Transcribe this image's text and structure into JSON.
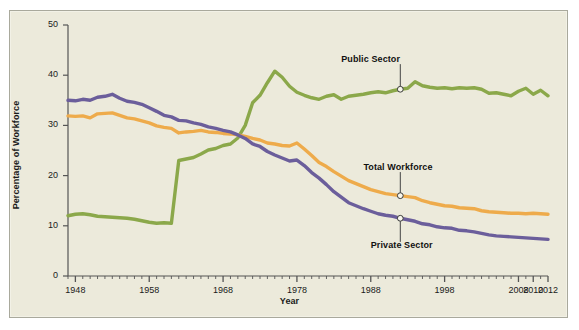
{
  "chart_data": {
    "type": "line",
    "title": "",
    "xlabel": "Year",
    "ylabel": "Percentage of Workforce",
    "xlim": [
      1947,
      2012
    ],
    "ylim": [
      0,
      50
    ],
    "y_ticks": [
      0,
      10,
      20,
      30,
      40,
      50
    ],
    "x_tick_labels": [
      "1948",
      "1958",
      "1968",
      "1978",
      "1988",
      "1998",
      "2008",
      "2010",
      "2012"
    ],
    "x_tick_values": [
      1948,
      1958,
      1968,
      1978,
      1988,
      1998,
      2008,
      2010,
      2012
    ],
    "minor_tick_interval": 1,
    "grid": false,
    "legend": "inline-annotations",
    "colors": {
      "public_sector": "#8ba84a",
      "total_workforce": "#eeab4b",
      "private_sector": "#6b5e9b",
      "background": "#eceadb",
      "frame": "#a9a99c",
      "axis": "#555555",
      "text": "#1a1a1a"
    },
    "series": [
      {
        "name": "Public Sector",
        "color": "#8ba84a",
        "x": [
          1947,
          1948,
          1949,
          1950,
          1951,
          1952,
          1953,
          1954,
          1955,
          1956,
          1957,
          1958,
          1959,
          1960,
          1961,
          1962,
          1963,
          1964,
          1965,
          1966,
          1967,
          1968,
          1969,
          1970,
          1971,
          1972,
          1973,
          1974,
          1975,
          1976,
          1977,
          1978,
          1979,
          1980,
          1981,
          1982,
          1983,
          1984,
          1985,
          1986,
          1987,
          1988,
          1989,
          1990,
          1991,
          1992,
          1993,
          1994,
          1995,
          1996,
          1997,
          1998,
          1999,
          2000,
          2001,
          2002,
          2003,
          2004,
          2005,
          2006,
          2007,
          2008,
          2009,
          2010,
          2011,
          2012
        ],
        "y": [
          12.0,
          12.3,
          12.4,
          12.2,
          11.9,
          11.8,
          11.7,
          11.6,
          11.5,
          11.3,
          11.0,
          10.7,
          10.5,
          10.6,
          10.5,
          23.0,
          23.3,
          23.6,
          24.3,
          25.1,
          25.4,
          26.0,
          26.3,
          27.5,
          30.0,
          34.5,
          36.0,
          38.5,
          40.8,
          39.6,
          37.8,
          36.6,
          36.0,
          35.5,
          35.2,
          35.8,
          36.1,
          35.2,
          35.8,
          36.0,
          36.2,
          36.5,
          36.7,
          36.5,
          36.9,
          37.2,
          37.4,
          38.7,
          37.9,
          37.6,
          37.4,
          37.5,
          37.3,
          37.5,
          37.4,
          37.5,
          37.2,
          36.4,
          36.5,
          36.2,
          35.9,
          36.8,
          37.4,
          36.2,
          37.0,
          35.9
        ]
      },
      {
        "name": "Total Workforce",
        "color": "#eeab4b",
        "x": [
          1947,
          1948,
          1949,
          1950,
          1951,
          1952,
          1953,
          1954,
          1955,
          1956,
          1957,
          1958,
          1959,
          1960,
          1961,
          1962,
          1963,
          1964,
          1965,
          1966,
          1967,
          1968,
          1969,
          1970,
          1971,
          1972,
          1973,
          1974,
          1975,
          1976,
          1977,
          1978,
          1979,
          1980,
          1981,
          1982,
          1983,
          1984,
          1985,
          1986,
          1987,
          1988,
          1989,
          1990,
          1991,
          1992,
          1993,
          1994,
          1995,
          1996,
          1997,
          1998,
          1999,
          2000,
          2001,
          2002,
          2003,
          2004,
          2005,
          2006,
          2007,
          2008,
          2009,
          2010,
          2011,
          2012
        ],
        "y": [
          31.9,
          31.8,
          31.9,
          31.5,
          32.3,
          32.4,
          32.5,
          32.0,
          31.5,
          31.3,
          30.9,
          30.5,
          29.9,
          29.6,
          29.4,
          28.5,
          28.7,
          28.8,
          29.0,
          28.7,
          28.6,
          28.4,
          28.3,
          28.1,
          27.8,
          27.4,
          27.1,
          26.5,
          26.3,
          26.0,
          25.9,
          26.5,
          25.3,
          24.0,
          22.6,
          21.8,
          20.8,
          19.9,
          19.0,
          18.4,
          17.8,
          17.2,
          16.8,
          16.4,
          16.2,
          16.0,
          15.8,
          15.6,
          15.0,
          14.6,
          14.3,
          14.0,
          13.9,
          13.6,
          13.5,
          13.4,
          13.0,
          12.8,
          12.7,
          12.6,
          12.5,
          12.5,
          12.4,
          12.5,
          12.4,
          12.3
        ]
      },
      {
        "name": "Private Sector",
        "color": "#6b5e9b",
        "x": [
          1947,
          1948,
          1949,
          1950,
          1951,
          1952,
          1953,
          1954,
          1955,
          1956,
          1957,
          1958,
          1959,
          1960,
          1961,
          1962,
          1963,
          1964,
          1965,
          1966,
          1967,
          1968,
          1969,
          1970,
          1971,
          1972,
          1973,
          1974,
          1975,
          1976,
          1977,
          1978,
          1979,
          1980,
          1981,
          1982,
          1983,
          1984,
          1985,
          1986,
          1987,
          1988,
          1989,
          1990,
          1991,
          1992,
          1993,
          1994,
          1995,
          1996,
          1997,
          1998,
          1999,
          2000,
          2001,
          2002,
          2003,
          2004,
          2005,
          2006,
          2007,
          2008,
          2009,
          2010,
          2011,
          2012
        ],
        "y": [
          35.0,
          34.9,
          35.2,
          35.0,
          35.6,
          35.8,
          36.2,
          35.4,
          34.8,
          34.6,
          34.2,
          33.5,
          32.8,
          32.0,
          31.7,
          31.0,
          30.9,
          30.5,
          30.2,
          29.7,
          29.4,
          29.0,
          28.7,
          28.1,
          27.4,
          26.3,
          25.8,
          24.8,
          24.1,
          23.5,
          22.9,
          23.1,
          22.0,
          20.6,
          19.5,
          18.2,
          16.8,
          15.7,
          14.6,
          14.0,
          13.4,
          12.9,
          12.4,
          12.1,
          11.9,
          11.5,
          11.2,
          10.9,
          10.4,
          10.2,
          9.8,
          9.6,
          9.5,
          9.1,
          9.0,
          8.8,
          8.5,
          8.2,
          8.0,
          7.9,
          7.8,
          7.7,
          7.6,
          7.5,
          7.4,
          7.3
        ]
      }
    ],
    "annotations": [
      {
        "label": "Public Sector",
        "series": "Public Sector",
        "marker_x": 1992,
        "marker_y": 37.2,
        "label_x": 1984,
        "label_y": 43.0
      },
      {
        "label": "Total Workforce",
        "series": "Total Workforce",
        "marker_x": 1992,
        "marker_y": 16.0,
        "label_x": 1987,
        "label_y": 21.5
      },
      {
        "label": "Private Sector",
        "series": "Private Sector",
        "marker_x": 1992,
        "marker_y": 11.5,
        "label_x": 1988,
        "label_y": 6.0
      }
    ]
  }
}
